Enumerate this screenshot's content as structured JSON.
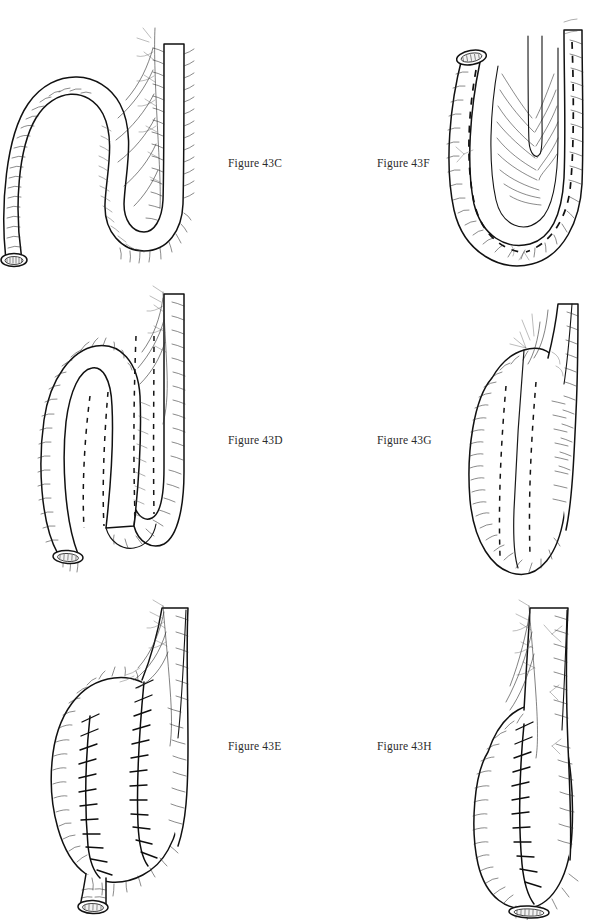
{
  "plate": {
    "title": "Figure 43 C-H",
    "style": "pen-and-ink surgical line illustration",
    "background_color": "#ffffff",
    "ink_color": "#111111",
    "width": 603,
    "height": 920,
    "columns": 2,
    "rows": 3
  },
  "labels": {
    "c": "Figure 43C",
    "d": "Figure 43D",
    "e": "Figure 43E",
    "f": "Figure 43F",
    "g": "Figure 43G",
    "h": "Figure 43H"
  },
  "panels": [
    {
      "id": "43C",
      "label": "Figure 43C",
      "column": "left",
      "row": 1,
      "subject": "S-shaped bowel loop with mesentery",
      "features": [
        "cut-end-stoma-lower-left",
        "mesenteric-vessels-upper-right",
        "serosal-hatching"
      ]
    },
    {
      "id": "43D",
      "label": "Figure 43D",
      "column": "left",
      "row": 2,
      "subject": "folded bowel limbs with planned incision lines",
      "features": [
        "cut-end-stoma-lower-left",
        "two-dashed-incision-lines",
        "mesenteric-vessels-upper-right"
      ]
    },
    {
      "id": "43E",
      "label": "Figure 43E",
      "column": "left",
      "row": 3,
      "subject": "completed pouch with two suture rows",
      "features": [
        "cut-end-stoma-bottom",
        "two-running-suture-lines",
        "mesenteric-vessels-upper-right"
      ]
    },
    {
      "id": "43F",
      "label": "Figure 43F",
      "column": "right",
      "row": 1,
      "subject": "U-shaped bowel loop opened along antimesenteric border",
      "features": [
        "cut-end-stoma-top-left",
        "two-dashed-incision-lines",
        "mucosal-folds-centre"
      ]
    },
    {
      "id": "43G",
      "label": "Figure 43G",
      "column": "right",
      "row": 2,
      "subject": "closed pouch with dashed suture guide lines",
      "features": [
        "two-dashed-lines",
        "central-fold",
        "serosal-hatching"
      ]
    },
    {
      "id": "43H",
      "label": "Figure 43H",
      "column": "right",
      "row": 3,
      "subject": "completed pouch with single midline suture row",
      "features": [
        "cut-end-stoma-bottom",
        "single-running-suture-line",
        "mesenteric-vessels-top"
      ]
    }
  ]
}
